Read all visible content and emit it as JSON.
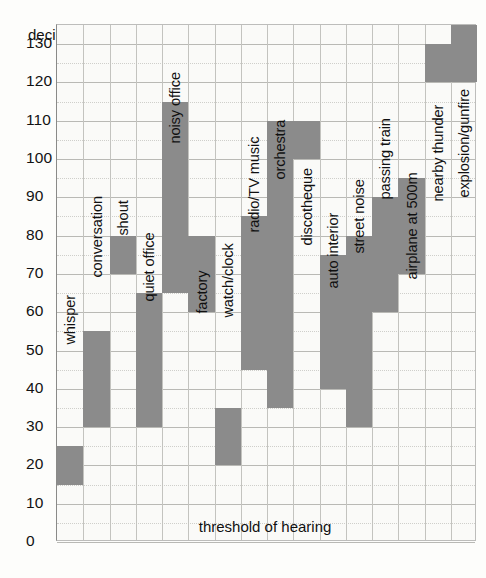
{
  "chart_data": {
    "type": "bar",
    "title": "decibels (dB)",
    "xlabel": "",
    "ylabel": "decibels (dB)",
    "ylim": [
      0,
      135
    ],
    "ytick_values": [
      0,
      10,
      20,
      30,
      40,
      50,
      60,
      70,
      80,
      90,
      100,
      110,
      120,
      130
    ],
    "ytick_labels": [
      "0",
      "10",
      "20",
      "30",
      "40",
      "50",
      "60",
      "70",
      "80",
      "90",
      "100",
      "110",
      "120",
      "130"
    ],
    "grid": true,
    "legend": "none",
    "annotation": "threshold of hearing",
    "bar_color": "#8b8b8b",
    "categories": [
      "whisper",
      "conversation",
      "shout",
      "quiet office",
      "noisy office",
      "factory",
      "watch/clock",
      "radio/TV music",
      "orchestra",
      "discotheque",
      "auto interior",
      "street noise",
      "passing train",
      "airplane at 500m",
      "nearby thunder",
      "explosion/gunfire"
    ],
    "ranges": [
      {
        "label": "whisper",
        "low": 15,
        "high": 25,
        "col": 0
      },
      {
        "label": "conversation",
        "low": 30,
        "high": 55,
        "col": 1
      },
      {
        "label": "shout",
        "low": 70,
        "high": 80,
        "col": 2
      },
      {
        "label": "quiet office",
        "low": 30,
        "high": 65,
        "col": 3
      },
      {
        "label": "noisy office",
        "low": 65,
        "high": 115,
        "col": 4
      },
      {
        "label": "factory",
        "low": 60,
        "high": 80,
        "col": 5
      },
      {
        "label": "watch/clock",
        "low": 20,
        "high": 35,
        "col": 6
      },
      {
        "label": "radio/TV music",
        "low": 45,
        "high": 85,
        "col": 7
      },
      {
        "label": "orchestra",
        "low": 35,
        "high": 110,
        "col": 8
      },
      {
        "label": "discotheque",
        "low": 100,
        "high": 110,
        "col": 9
      },
      {
        "label": "auto interior",
        "low": 40,
        "high": 75,
        "col": 10
      },
      {
        "label": "street noise",
        "low": 30,
        "high": 80,
        "col": 11
      },
      {
        "label": "passing train",
        "low": 60,
        "high": 90,
        "col": 12
      },
      {
        "label": "airplane at 500m",
        "low": 70,
        "high": 95,
        "col": 13
      },
      {
        "label": "nearby thunder",
        "low": 120,
        "high": 130,
        "col": 14
      },
      {
        "label": "explosion/gunfire",
        "low": 120,
        "high": 135,
        "col": 15
      }
    ],
    "label_tops": [
      305,
      238,
      196,
      262,
      104,
      274,
      278,
      193,
      140,
      206,
      249,
      214,
      160,
      240,
      162,
      158
    ]
  }
}
